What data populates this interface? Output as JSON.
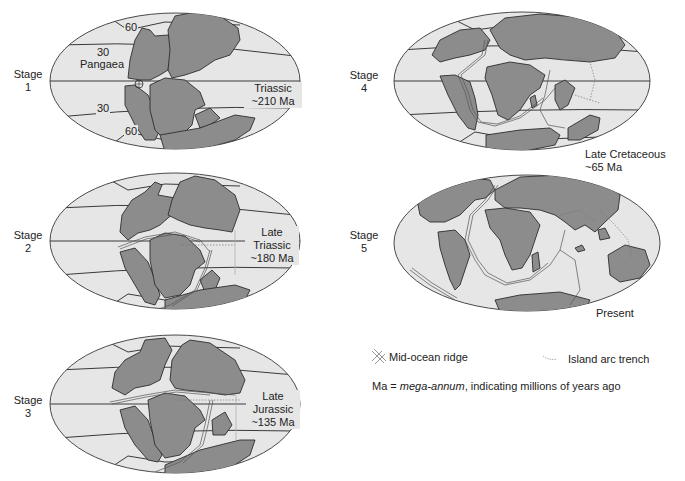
{
  "figure": {
    "colors": {
      "land": "#8c8c8c",
      "ocean": "#e6e6e6",
      "outline": "#3a3a3a",
      "ridge": "#bdbdbd",
      "trench": "#7a7a7a"
    }
  },
  "stages": [
    {
      "id": "stage-1",
      "stage_label_line1": "Stage",
      "stage_label_line2": "1",
      "period_line1": "Triassic",
      "period_line2": "~210 Ma",
      "period_line3": "",
      "supercontinent": "Pangaea",
      "latitude_labels": [
        "60",
        "30",
        "30",
        "60"
      ]
    },
    {
      "id": "stage-2",
      "stage_label_line1": "Stage",
      "stage_label_line2": "2",
      "period_line1": "Late",
      "period_line2": "Triassic",
      "period_line3": "~180 Ma"
    },
    {
      "id": "stage-3",
      "stage_label_line1": "Stage",
      "stage_label_line2": "3",
      "period_line1": "Late",
      "period_line2": "Jurassic",
      "period_line3": "~135 Ma"
    },
    {
      "id": "stage-4",
      "stage_label_line1": "Stage",
      "stage_label_line2": "4",
      "period_line1": "Late Cretaceous",
      "period_line2": "~65 Ma"
    },
    {
      "id": "stage-5",
      "stage_label_line1": "Stage",
      "stage_label_line2": "5",
      "period_line1": "Present"
    }
  ],
  "legend": {
    "ridge_label": "Mid-ocean ridge",
    "trench_label": "Island arc trench",
    "ma_prefix": "Ma = ",
    "ma_term": "mega-annum",
    "ma_suffix": ", indicating millions of years ago"
  }
}
